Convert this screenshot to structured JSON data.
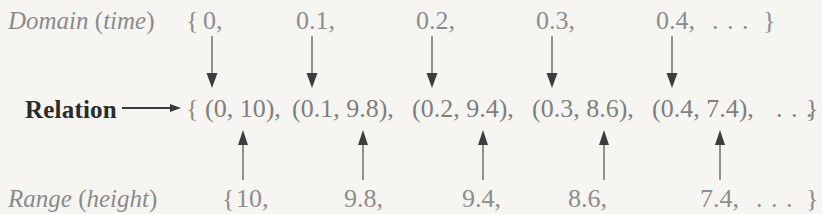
{
  "figure": {
    "caption_absent": true,
    "background_color": "#f6f5f1",
    "ink_gray": "#8d8d8d",
    "ink_black": "#2b2b2b"
  },
  "domain_row": {
    "label_main": "Domain",
    "label_paren_open": " (",
    "label_paren_word": "time",
    "label_paren_close": ")",
    "open_brace": "{",
    "values": [
      "0,",
      "0.1,",
      "0.2,",
      "0.3,",
      "0.4,"
    ],
    "ellipsis": ". . .",
    "close_brace": "}"
  },
  "relation_row": {
    "label": "Relation",
    "arrow_glyph": "long-right-arrow",
    "open_brace": "{",
    "pairs": [
      "(0, 10),",
      "(0.1, 9.8),",
      "(0.2, 9.4),",
      "(0.3, 8.6),",
      "(0.4, 7.4),"
    ],
    "ellipsis": ". . .",
    "close_brace": "}"
  },
  "range_row": {
    "label_main": "Range",
    "label_paren_open": " (",
    "label_paren_word": "height",
    "label_paren_close": ")",
    "open_brace": "{",
    "values": [
      "10,",
      "9.8,",
      "9.4,",
      "8.6,",
      "7.4,"
    ],
    "ellipsis": ". . .",
    "close_brace": "}"
  },
  "connectors": {
    "down_arrows_label": "domain-to-relation-arrow",
    "up_arrows_label": "range-to-relation-arrow",
    "down_arrow_count": 5,
    "up_arrow_count": 5
  }
}
